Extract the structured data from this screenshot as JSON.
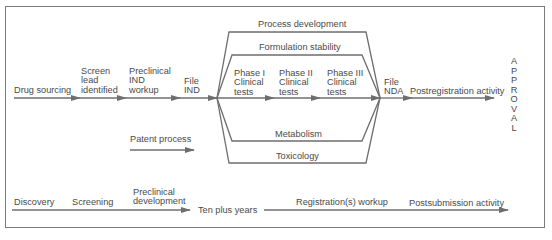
{
  "diagram": {
    "main_flow": [
      {
        "id": "drug-sourcing",
        "label": "Drug sourcing"
      },
      {
        "id": "screen-lead",
        "label": [
          "Screen",
          "lead",
          "identified"
        ]
      },
      {
        "id": "preclinical-ind",
        "label": [
          "Preclinical",
          "IND",
          "workup"
        ]
      },
      {
        "id": "file-ind",
        "label": [
          "File",
          "IND"
        ]
      },
      {
        "id": "phase-1",
        "label": [
          "Phase I",
          "Clinical",
          "tests"
        ]
      },
      {
        "id": "phase-2",
        "label": [
          "Phase II",
          "Clinical",
          "tests"
        ]
      },
      {
        "id": "phase-3",
        "label": [
          "Phase III",
          "Clinical",
          "tests"
        ]
      },
      {
        "id": "file-nda",
        "label": [
          "File",
          "NDA"
        ]
      },
      {
        "id": "postregistration",
        "label": "Postregistration activity"
      }
    ],
    "parallel_tracks": {
      "process_development": "Process development",
      "formulation_stability": "Formulation stability",
      "metabolism": "Metabolism",
      "toxicology": "Toxicology"
    },
    "patent_process": "Patent process",
    "approval": [
      "A",
      "P",
      "P",
      "R",
      "O",
      "V",
      "A",
      "L"
    ],
    "timeline": {
      "discovery": "Discovery",
      "screening": "Screening",
      "preclinical_development": [
        "Preclinical",
        "development"
      ],
      "duration": "Ten plus years",
      "registration_workup": "Registration(s) workup",
      "postsubmission": "Postsubmission activity"
    },
    "colors": {
      "line": "#6e6e6e",
      "text": "#4a4a4a",
      "frame": "#7a7a7a"
    }
  }
}
